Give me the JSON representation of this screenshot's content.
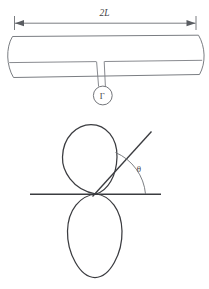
{
  "figure": {
    "background_color": "#ffffff",
    "ink_color": "#3b3c40",
    "light_ink_color": "#7a7d82",
    "upper_panel": {
      "name": "spanwise-tube-with-circulation",
      "dimension": {
        "label": "2L",
        "style": "italic",
        "left_arrow": "arrow-left",
        "right_arrow": "arrow-right",
        "description": "double headed dimension arrow spanning full tube width"
      },
      "tube": {
        "description": "long horizontal tube drawn in perspective with bowed left and right end caps and an interior horizontal edge line"
      },
      "slot": {
        "description": "narrow vertical channel descending from the tube interior line to the circulation marker"
      },
      "circulation_marker": {
        "symbol": "Γ",
        "symbol_name": "capital-gamma",
        "meaning": "circulation",
        "shape": "circle"
      }
    },
    "lower_panel": {
      "name": "figure-eight-lobes-with-angle",
      "upper_lobe": {
        "description": "vertical ellipse above the horizontal axis, tangent at the node"
      },
      "lower_lobe": {
        "description": "vertical ellipse below the horizontal axis, tangent at the node"
      },
      "axis": {
        "label": "",
        "description": "horizontal reference axis through the node"
      },
      "ray": {
        "description": "straight ray from the node inclined up and to the right"
      },
      "angle": {
        "label": "θ",
        "label_name": "theta",
        "value_degrees": 49,
        "description": "angle between the horizontal axis and the inclined ray, marked with an arc"
      }
    }
  }
}
